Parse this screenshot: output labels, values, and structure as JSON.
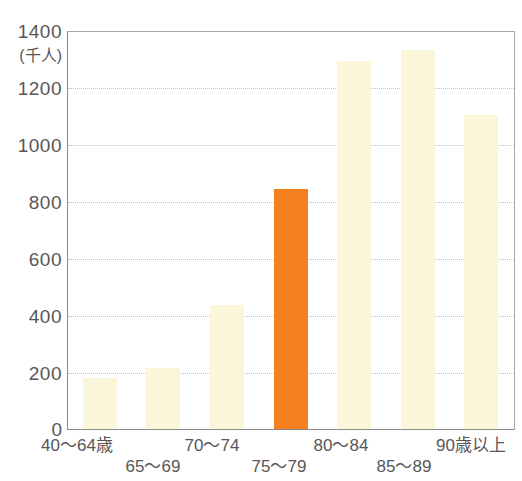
{
  "chart_data": {
    "type": "bar",
    "title": "",
    "xlabel": "",
    "ylabel": "",
    "unit_label": "(千人)",
    "categories": [
      "40〜64歳",
      "65〜69",
      "70〜74",
      "75〜79",
      "80〜84",
      "85〜89",
      "90歳以上"
    ],
    "values": [
      180,
      215,
      440,
      850,
      1300,
      1340,
      1110
    ],
    "ylim": [
      0,
      1400
    ],
    "ytick_values": [
      0,
      200,
      400,
      600,
      800,
      1000,
      1200,
      1400
    ],
    "ytick_labels": [
      "0",
      "200",
      "400",
      "600",
      "800",
      "1000",
      "1200",
      "1400"
    ],
    "grid": true,
    "legend": "none",
    "highlight_index": 3,
    "colors": {
      "bar_default": "#FBF6D9",
      "bar_highlight": "#F4801F",
      "gridline": "#b9b6b0",
      "axis": "#8d8a8b",
      "text": "#5a5658"
    }
  }
}
